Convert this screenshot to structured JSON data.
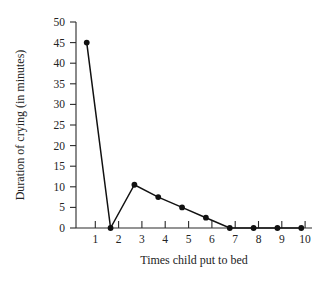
{
  "chart_data": {
    "type": "line",
    "title": "",
    "xlabel": "Times child put to bed",
    "ylabel": "Duration of crying (in minutes)",
    "x": [
      1,
      2,
      3,
      4,
      5,
      6,
      7,
      8,
      9,
      10
    ],
    "values": [
      45,
      0,
      10.5,
      7.5,
      5,
      2.5,
      0,
      0,
      0,
      0
    ],
    "xlim": [
      0.55,
      10.45
    ],
    "ylim": [
      0,
      50
    ],
    "xticks": [
      1,
      2,
      3,
      4,
      5,
      6,
      7,
      8,
      9,
      10
    ],
    "xtick_labels": [
      "1",
      "2",
      "3",
      "4",
      "5",
      "6",
      "7",
      "8",
      "9",
      "10"
    ],
    "yticks": [
      0,
      5,
      10,
      15,
      20,
      25,
      30,
      35,
      40,
      45,
      50
    ],
    "ytick_labels": [
      "0",
      "5",
      "10",
      "15",
      "20",
      "25",
      "30",
      "35",
      "40",
      "45",
      "50"
    ],
    "grid": false,
    "legend": null,
    "marker": "filled-circle",
    "line_color": "#111111",
    "marker_color": "#111111",
    "axis_color": "#2a2a2a",
    "background_color": "#ffffff"
  },
  "axis_titles": {
    "x": "Times child put to bed",
    "y": "Duration of crying (in minutes)"
  },
  "ytick_labels": {
    "t0": "0",
    "t1": "5",
    "t2": "10",
    "t3": "15",
    "t4": "20",
    "t5": "25",
    "t6": "30",
    "t7": "35",
    "t8": "40",
    "t9": "45",
    "t10": "50"
  },
  "xtick_labels": {
    "t0": "1",
    "t1": "2",
    "t2": "3",
    "t3": "4",
    "t4": "5",
    "t5": "6",
    "t6": "7",
    "t7": "8",
    "t8": "9",
    "t9": "10"
  }
}
